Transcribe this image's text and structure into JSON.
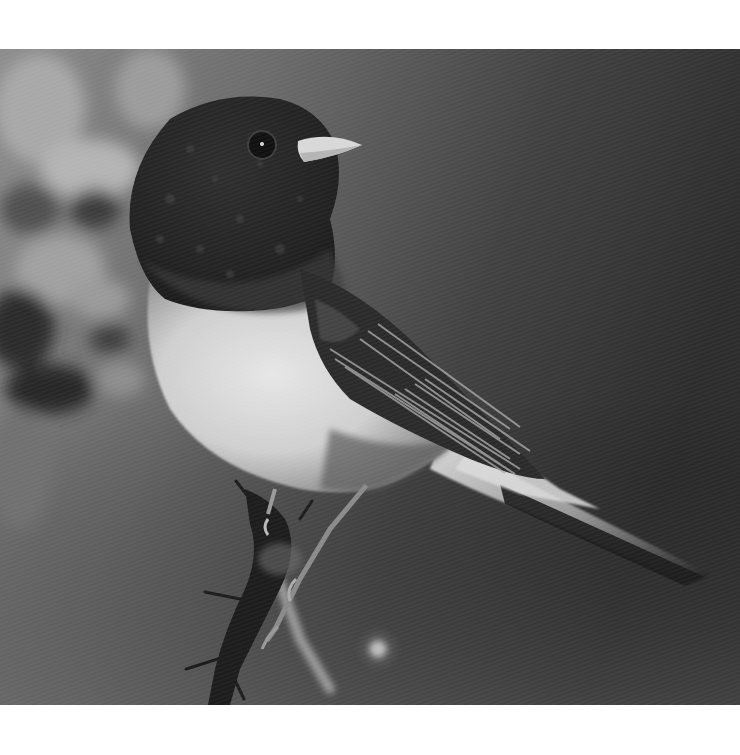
{
  "image": {
    "subject": "Dark-eyed junco perched on a thorny branch",
    "style": "grayscale photograph",
    "colors": {
      "margin": "#ffffff",
      "background_left": "#8a8a8a",
      "background_right": "#2e2e2e",
      "head": "#262626",
      "breast": "#d8d8d8",
      "beak": "#dcdcdc",
      "branch": "#1c1c1c"
    }
  }
}
